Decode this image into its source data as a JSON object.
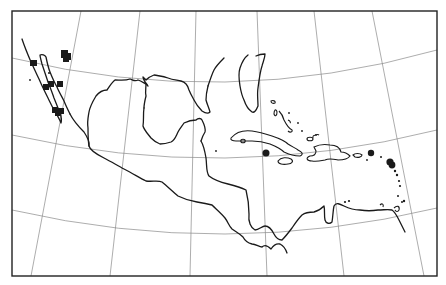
{
  "map": {
    "title": "",
    "region": "Mexico, Central America, Gulf of Mexico and Caribbean",
    "colors": {
      "background": "#ffffff",
      "coastline": "#1a1a1a",
      "graticule": "#8a8a8a",
      "marker": "#1a1a1a"
    },
    "frame": {
      "x": 12,
      "y": 11,
      "width": 425,
      "height": 265
    },
    "graticule": {
      "meridians": [
        {
          "top": [
            81,
            11
          ],
          "bottom": [
            31,
            276
          ]
        },
        {
          "top": [
            140,
            11
          ],
          "bottom": [
            110,
            276
          ]
        },
        {
          "top": [
            196,
            11
          ],
          "bottom": [
            190,
            276
          ]
        },
        {
          "top": [
            257,
            11
          ],
          "bottom": [
            267,
            276
          ]
        },
        {
          "top": [
            314,
            11
          ],
          "bottom": [
            344,
            276
          ]
        },
        {
          "top": [
            372,
            11
          ],
          "bottom": [
            424,
            276
          ]
        }
      ],
      "parallels": [
        {
          "left": [
            12,
            58
          ],
          "mid": [
            225,
            82
          ],
          "right": [
            437,
            50
          ]
        },
        {
          "left": [
            12,
            135
          ],
          "mid": [
            225,
            158
          ],
          "right": [
            437,
            130
          ]
        },
        {
          "left": [
            12,
            210
          ],
          "mid": [
            225,
            234
          ],
          "right": [
            437,
            208
          ]
        }
      ]
    },
    "legend": [
      {
        "symbol": "square",
        "label": ""
      },
      {
        "symbol": "circle",
        "label": ""
      }
    ],
    "markers": {
      "squares": [
        {
          "x": 61,
          "y": 50,
          "w": 7,
          "h": 8
        },
        {
          "x": 64,
          "y": 53,
          "w": 7,
          "h": 7
        },
        {
          "x": 63,
          "y": 57,
          "w": 6,
          "h": 5
        },
        {
          "x": 30,
          "y": 60,
          "w": 7,
          "h": 6
        },
        {
          "x": 43,
          "y": 84,
          "w": 6,
          "h": 6
        },
        {
          "x": 48,
          "y": 81,
          "w": 6,
          "h": 6
        },
        {
          "x": 57,
          "y": 81,
          "w": 6,
          "h": 6
        },
        {
          "x": 52,
          "y": 107,
          "w": 6,
          "h": 6
        },
        {
          "x": 58,
          "y": 108,
          "w": 6,
          "h": 6
        },
        {
          "x": 55,
          "y": 112,
          "w": 5,
          "h": 4
        }
      ],
      "dots": [
        {
          "x": 266,
          "y": 153,
          "r": 3.5
        },
        {
          "x": 371,
          "y": 153,
          "r": 3.2
        },
        {
          "x": 390,
          "y": 162,
          "r": 3.6
        },
        {
          "x": 392,
          "y": 165,
          "r": 3.4
        }
      ]
    }
  }
}
